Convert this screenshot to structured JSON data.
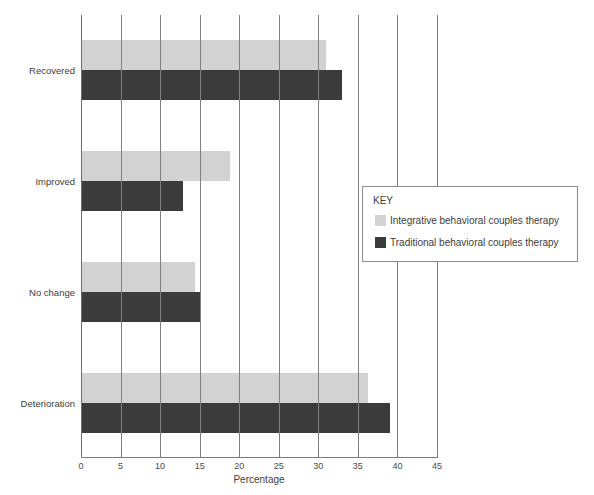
{
  "chart_data": {
    "type": "bar",
    "orientation": "horizontal",
    "title": "",
    "xlabel": "Percentage",
    "ylabel": "",
    "xlim": [
      0,
      45
    ],
    "xticks": [
      0,
      5,
      10,
      15,
      20,
      25,
      30,
      35,
      40,
      45
    ],
    "xtick_labels": [
      "0",
      "5",
      "10",
      "15",
      "20",
      "25",
      "30",
      "35",
      "40",
      "45"
    ],
    "grid": "vertical",
    "categories": [
      "Recovered",
      "Improved",
      "No change",
      "Deterioration"
    ],
    "series": [
      {
        "name": "Integrative behavioral couples therapy",
        "color": "#d2d2d2",
        "values": [
          31,
          18.8,
          14.4,
          36.3
        ]
      },
      {
        "name": "Traditional behavioral couples therapy",
        "color": "#3b3b3b",
        "values": [
          33,
          12.9,
          15,
          39
        ]
      }
    ],
    "legend": {
      "title": "KEY",
      "position": "center-right",
      "entries": [
        {
          "label": "Integrative behavioral couples therapy",
          "color": "#d2d2d2"
        },
        {
          "label": "Traditional behavioral couples therapy",
          "color": "#3b3b3b"
        }
      ]
    }
  },
  "axis": {
    "x_title": "Percentage",
    "tick_labels": [
      "0",
      "5",
      "10",
      "15",
      "20",
      "25",
      "30",
      "35",
      "40",
      "45"
    ]
  },
  "categories": {
    "0": "Recovered",
    "1": "Improved",
    "2": "No change",
    "3": "Deterioration"
  },
  "legend": {
    "title": "KEY",
    "entry_0": "Integrative behavioral couples therapy",
    "entry_1": "Traditional behavioral couples therapy"
  },
  "colors": {
    "light_series": "#d2d2d2",
    "dark_series": "#3b3b3b",
    "gridline": "#808080",
    "text": "#3d3d3d",
    "background": "#ffffff"
  }
}
